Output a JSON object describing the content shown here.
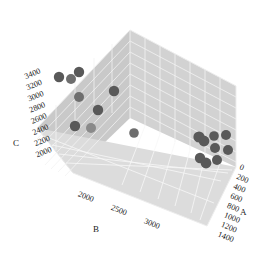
{
  "chart_data": {
    "type": "scatter",
    "projection": "3d",
    "title": "",
    "xlabel": "A",
    "ylabel": "B",
    "zlabel": "C",
    "axes": {
      "A": {
        "label": "A",
        "ticks": [
          0,
          200,
          400,
          600,
          800,
          1000,
          1200,
          1400
        ],
        "tick_labels": [
          "0",
          "200",
          "400",
          "600",
          "800",
          "1000",
          "1200",
          "1400"
        ],
        "lim": [
          0,
          1400
        ]
      },
      "B": {
        "label": "B",
        "ticks": [
          2000,
          2500,
          3000
        ],
        "tick_labels": [
          "2000",
          "2500",
          "3000"
        ],
        "lim": [
          1750,
          3250
        ]
      },
      "C": {
        "label": "C",
        "ticks": [
          2000,
          2200,
          2400,
          2600,
          2800,
          3000,
          3200,
          3400
        ],
        "tick_labels": [
          "2000",
          "2200",
          "2400",
          "2600",
          "2800",
          "3000",
          "3200",
          "3400"
        ],
        "lim": [
          1900,
          3500
        ]
      }
    },
    "grid": true,
    "legend": false,
    "marker_color_dark": "#595959",
    "marker_color_mid": "#6e6e6e",
    "marker_color_light": "#8a8a8a",
    "background_color": "#ffffff",
    "panel_color": "#d2d2d2",
    "points": [
      {
        "A": 120,
        "B": 2050,
        "C": 3400,
        "px": 59,
        "py": 77,
        "r": 5.2,
        "shade": "dark"
      },
      {
        "A": 190,
        "B": 2130,
        "C": 3370,
        "px": 71,
        "py": 79,
        "r": 5.0,
        "shade": "mid"
      },
      {
        "A": 250,
        "B": 2210,
        "C": 3440,
        "px": 79,
        "py": 72,
        "r": 5.2,
        "shade": "dark"
      },
      {
        "A": 210,
        "B": 2180,
        "C": 3180,
        "px": 79,
        "py": 97,
        "r": 5.0,
        "shade": "mid"
      },
      {
        "A": 430,
        "B": 2430,
        "C": 3230,
        "px": 114,
        "py": 91,
        "r": 5.2,
        "shade": "dark"
      },
      {
        "A": 350,
        "B": 2350,
        "C": 3040,
        "px": 98,
        "py": 110,
        "r": 5.2,
        "shade": "dark"
      },
      {
        "A": 190,
        "B": 2150,
        "C": 2820,
        "px": 75,
        "py": 126,
        "r": 5.2,
        "shade": "dark"
      },
      {
        "A": 270,
        "B": 2260,
        "C": 2790,
        "px": 91,
        "py": 128,
        "r": 5.0,
        "shade": "light"
      },
      {
        "A": 620,
        "B": 2620,
        "C": 2680,
        "px": 134,
        "py": 133,
        "r": 4.8,
        "shade": "mid"
      },
      {
        "A": 1180,
        "B": 3050,
        "C": 2650,
        "px": 199,
        "py": 137,
        "r": 5.6,
        "shade": "dark"
      },
      {
        "A": 1205,
        "B": 3070,
        "C": 2630,
        "px": 204,
        "py": 141,
        "r": 5.4,
        "shade": "dark"
      },
      {
        "A": 1260,
        "B": 3110,
        "C": 2670,
        "px": 214,
        "py": 136,
        "r": 4.8,
        "shade": "dark"
      },
      {
        "A": 1320,
        "B": 3160,
        "C": 2680,
        "px": 226,
        "py": 135,
        "r": 5.0,
        "shade": "dark"
      },
      {
        "A": 1265,
        "B": 3115,
        "C": 2590,
        "px": 215,
        "py": 148,
        "r": 5.0,
        "shade": "dark"
      },
      {
        "A": 1330,
        "B": 3170,
        "C": 2580,
        "px": 228,
        "py": 150,
        "r": 5.0,
        "shade": "dark"
      },
      {
        "A": 1185,
        "B": 3055,
        "C": 2520,
        "px": 200,
        "py": 158,
        "r": 5.2,
        "shade": "dark"
      },
      {
        "A": 1215,
        "B": 3080,
        "C": 2480,
        "px": 206,
        "py": 163,
        "r": 5.4,
        "shade": "dark"
      },
      {
        "A": 1275,
        "B": 3120,
        "C": 2500,
        "px": 217,
        "py": 160,
        "r": 5.0,
        "shade": "dark"
      }
    ]
  }
}
